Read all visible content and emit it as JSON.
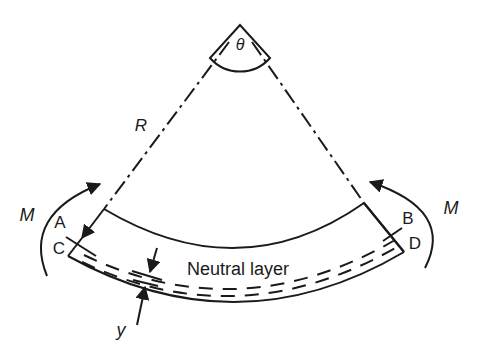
{
  "diagram": {
    "type": "beam-bending",
    "angle_label": "θ",
    "radius_label": "R",
    "moment_left_label": "M",
    "moment_right_label": "M",
    "point_labels": {
      "A": "A",
      "B": "B",
      "C": "C",
      "D": "D"
    },
    "neutral_layer_label": "Neutral layer",
    "distance_label": "y",
    "colors": {
      "ink": "#1a1a1a",
      "background": "#ffffff"
    }
  }
}
